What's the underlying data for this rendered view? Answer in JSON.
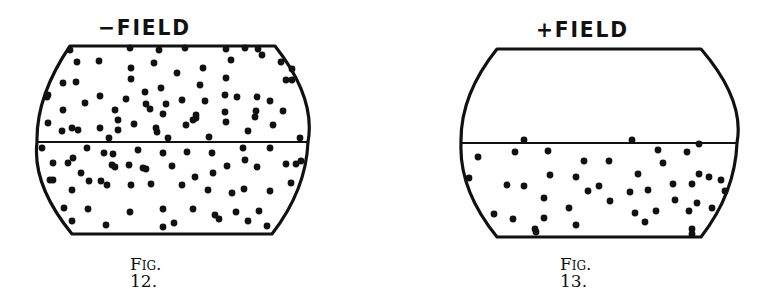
{
  "figures": [
    {
      "id": "fig12",
      "field_label": "−FIELD",
      "caption": "Fig. 12.",
      "caption_prefix": "Fig.",
      "caption_number": "12.",
      "shape": {
        "top_y": 46,
        "bottom_y": 234,
        "mid_y": 142,
        "top_left_x": 70,
        "top_right_x": 275,
        "bottom_left_x": 72,
        "bottom_right_x": 272,
        "bulge_left_x": 37,
        "bulge_right_x": 308
      },
      "description": "Particles dispersed throughout both halves of the vessel",
      "particles": [
        [
          70,
          50
        ],
        [
          99,
          61
        ],
        [
          130,
          48
        ],
        [
          159,
          50
        ],
        [
          185,
          48
        ],
        [
          226,
          49
        ],
        [
          245,
          48
        ],
        [
          258,
          49
        ],
        [
          77,
          62
        ],
        [
          131,
          68
        ],
        [
          154,
          63
        ],
        [
          203,
          68
        ],
        [
          231,
          60
        ],
        [
          262,
          55
        ],
        [
          281,
          62
        ],
        [
          292,
          69
        ],
        [
          177,
          73
        ],
        [
          47,
          97
        ],
        [
          63,
          83
        ],
        [
          76,
          82
        ],
        [
          131,
          79
        ],
        [
          145,
          92
        ],
        [
          161,
          88
        ],
        [
          200,
          85
        ],
        [
          226,
          78
        ],
        [
          292,
          80
        ],
        [
          286,
          80
        ],
        [
          48,
          95
        ],
        [
          85,
          103
        ],
        [
          100,
          96
        ],
        [
          126,
          99
        ],
        [
          146,
          104
        ],
        [
          166,
          104
        ],
        [
          182,
          100
        ],
        [
          205,
          101
        ],
        [
          225,
          95
        ],
        [
          237,
          97
        ],
        [
          257,
          97
        ],
        [
          270,
          101
        ],
        [
          63,
          110
        ],
        [
          115,
          110
        ],
        [
          150,
          109
        ],
        [
          163,
          114
        ],
        [
          196,
          115
        ],
        [
          225,
          112
        ],
        [
          256,
          111
        ],
        [
          283,
          111
        ],
        [
          196,
          118
        ],
        [
          48,
          123
        ],
        [
          72,
          128
        ],
        [
          100,
          128
        ],
        [
          118,
          120
        ],
        [
          134,
          124
        ],
        [
          156,
          128
        ],
        [
          186,
          125
        ],
        [
          193,
          120
        ],
        [
          226,
          122
        ],
        [
          255,
          117
        ],
        [
          273,
          125
        ],
        [
          62,
          131
        ],
        [
          78,
          130
        ],
        [
          118,
          130
        ],
        [
          157,
          132
        ],
        [
          248,
          131
        ],
        [
          109,
          138
        ],
        [
          168,
          138
        ],
        [
          209,
          137
        ],
        [
          300,
          138
        ]
      ],
      "particles_lower": [
        [
          42,
          148
        ],
        [
          87,
          148
        ],
        [
          104,
          153
        ],
        [
          113,
          154
        ],
        [
          138,
          150
        ],
        [
          163,
          153
        ],
        [
          187,
          152
        ],
        [
          212,
          153
        ],
        [
          243,
          148
        ],
        [
          270,
          148
        ],
        [
          53,
          163
        ],
        [
          73,
          158
        ],
        [
          50,
          180
        ],
        [
          68,
          163
        ],
        [
          245,
          160
        ],
        [
          301,
          161
        ],
        [
          286,
          164
        ],
        [
          112,
          165
        ],
        [
          129,
          165
        ],
        [
          143,
          168
        ],
        [
          172,
          166
        ],
        [
          227,
          166
        ],
        [
          257,
          167
        ],
        [
          296,
          164
        ],
        [
          81,
          173
        ],
        [
          101,
          181
        ],
        [
          115,
          167
        ],
        [
          146,
          169
        ],
        [
          195,
          177
        ],
        [
          213,
          173
        ],
        [
          53,
          180
        ],
        [
          72,
          190
        ],
        [
          89,
          181
        ],
        [
          107,
          185
        ],
        [
          131,
          185
        ],
        [
          151,
          184
        ],
        [
          182,
          185
        ],
        [
          208,
          190
        ],
        [
          232,
          193
        ],
        [
          244,
          189
        ],
        [
          270,
          191
        ],
        [
          291,
          183
        ],
        [
          64,
          208
        ],
        [
          88,
          209
        ],
        [
          130,
          212
        ],
        [
          163,
          209
        ],
        [
          193,
          209
        ],
        [
          215,
          215
        ],
        [
          236,
          212
        ],
        [
          259,
          211
        ],
        [
          72,
          221
        ],
        [
          106,
          225
        ],
        [
          163,
          227
        ],
        [
          174,
          223
        ],
        [
          219,
          219
        ],
        [
          248,
          221
        ],
        [
          267,
          226
        ]
      ]
    },
    {
      "id": "fig13",
      "field_label": "+FIELD",
      "caption": "Fig. 13.",
      "caption_prefix": "Fig.",
      "caption_number": "13.",
      "shape": {
        "top_y": 49,
        "bottom_y": 237,
        "mid_y": 143,
        "top_left_x": 497,
        "top_right_x": 701,
        "bottom_left_x": 497,
        "bottom_right_x": 701,
        "bulge_left_x": 461,
        "bulge_right_x": 737
      },
      "description": "Particles settled into the lower half of the vessel; upper half empty",
      "particles": [
        [
          524,
          140
        ],
        [
          632,
          140
        ],
        [
          699,
          144
        ],
        [
          478,
          157
        ],
        [
          515,
          152
        ],
        [
          548,
          151
        ],
        [
          658,
          150
        ],
        [
          687,
          152
        ],
        [
          584,
          161
        ],
        [
          609,
          161
        ],
        [
          663,
          163
        ],
        [
          709,
          177
        ],
        [
          469,
          178
        ],
        [
          507,
          185
        ],
        [
          524,
          186
        ],
        [
          550,
          175
        ],
        [
          576,
          177
        ],
        [
          599,
          186
        ],
        [
          638,
          174
        ],
        [
          648,
          190
        ],
        [
          699,
          174
        ],
        [
          721,
          180
        ],
        [
          544,
          198
        ],
        [
          588,
          191
        ],
        [
          630,
          192
        ],
        [
          673,
          184
        ],
        [
          692,
          184
        ],
        [
          725,
          191
        ],
        [
          494,
          214
        ],
        [
          513,
          219
        ],
        [
          544,
          218
        ],
        [
          569,
          208
        ],
        [
          610,
          201
        ],
        [
          635,
          213
        ],
        [
          656,
          211
        ],
        [
          675,
          200
        ],
        [
          689,
          211
        ],
        [
          697,
          203
        ],
        [
          712,
          208
        ],
        [
          535,
          229
        ],
        [
          576,
          225
        ],
        [
          645,
          222
        ],
        [
          692,
          229
        ],
        [
          536,
          232
        ],
        [
          692,
          234
        ]
      ]
    }
  ],
  "colors": {
    "ink": "#111111",
    "paper": "#ffffff"
  }
}
